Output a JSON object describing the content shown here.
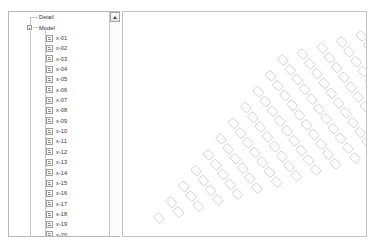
{
  "window": {
    "background_color": "#ffffff"
  },
  "tree_panel": {
    "name": "model-tree",
    "border_color": "#b9b9b9",
    "root_items": [
      {
        "label": "Detail",
        "expandable": false
      },
      {
        "label": "Model",
        "expandable": true,
        "expanded": true
      }
    ],
    "leaf_items": [
      {
        "label": "x-01",
        "icon": "document-icon"
      },
      {
        "label": "x-02",
        "icon": "document-icon"
      },
      {
        "label": "x-03",
        "icon": "document-icon"
      },
      {
        "label": "x-04",
        "icon": "document-icon"
      },
      {
        "label": "x-05",
        "icon": "document-icon"
      },
      {
        "label": "x-06",
        "icon": "document-icon"
      },
      {
        "label": "x-07",
        "icon": "document-icon"
      },
      {
        "label": "x-08",
        "icon": "document-icon"
      },
      {
        "label": "x-09",
        "icon": "document-icon"
      },
      {
        "label": "x-10",
        "icon": "document-icon"
      },
      {
        "label": "x-11",
        "icon": "document-icon"
      },
      {
        "label": "x-12",
        "icon": "document-icon"
      },
      {
        "label": "x-13",
        "icon": "document-icon"
      },
      {
        "label": "x-14",
        "icon": "document-icon"
      },
      {
        "label": "x-15",
        "icon": "document-icon"
      },
      {
        "label": "x-16",
        "icon": "document-icon"
      },
      {
        "label": "x-17",
        "icon": "document-icon"
      },
      {
        "label": "x-18",
        "icon": "document-icon"
      },
      {
        "label": "x-19",
        "icon": "document-icon"
      },
      {
        "label": "x-20",
        "icon": "document-icon"
      },
      {
        "label": "x-21",
        "icon": "document-icon"
      }
    ],
    "scrollbar": {
      "up_button_icon": "triangle-up-icon",
      "orientation": "vertical",
      "position": "top"
    }
  },
  "canvas": {
    "name": "drawing-canvas",
    "border_color": "#c3c3c3",
    "background_color": "#ffffff",
    "pattern": {
      "type": "sheared-grid-of-rounded-rectangles",
      "stroke_color": "#c9c9cf",
      "tile_rotation_deg": 45,
      "tile_width": 9,
      "tile_height": 7,
      "tile_corner_radius": 1.6,
      "rows": 11,
      "cols": 11,
      "origin_x": 36,
      "origin_y": 206,
      "col_step_x": 19.6,
      "col_step_y": -6.0,
      "row_step_x": 12.4,
      "row_step_y": -15.8
    }
  }
}
